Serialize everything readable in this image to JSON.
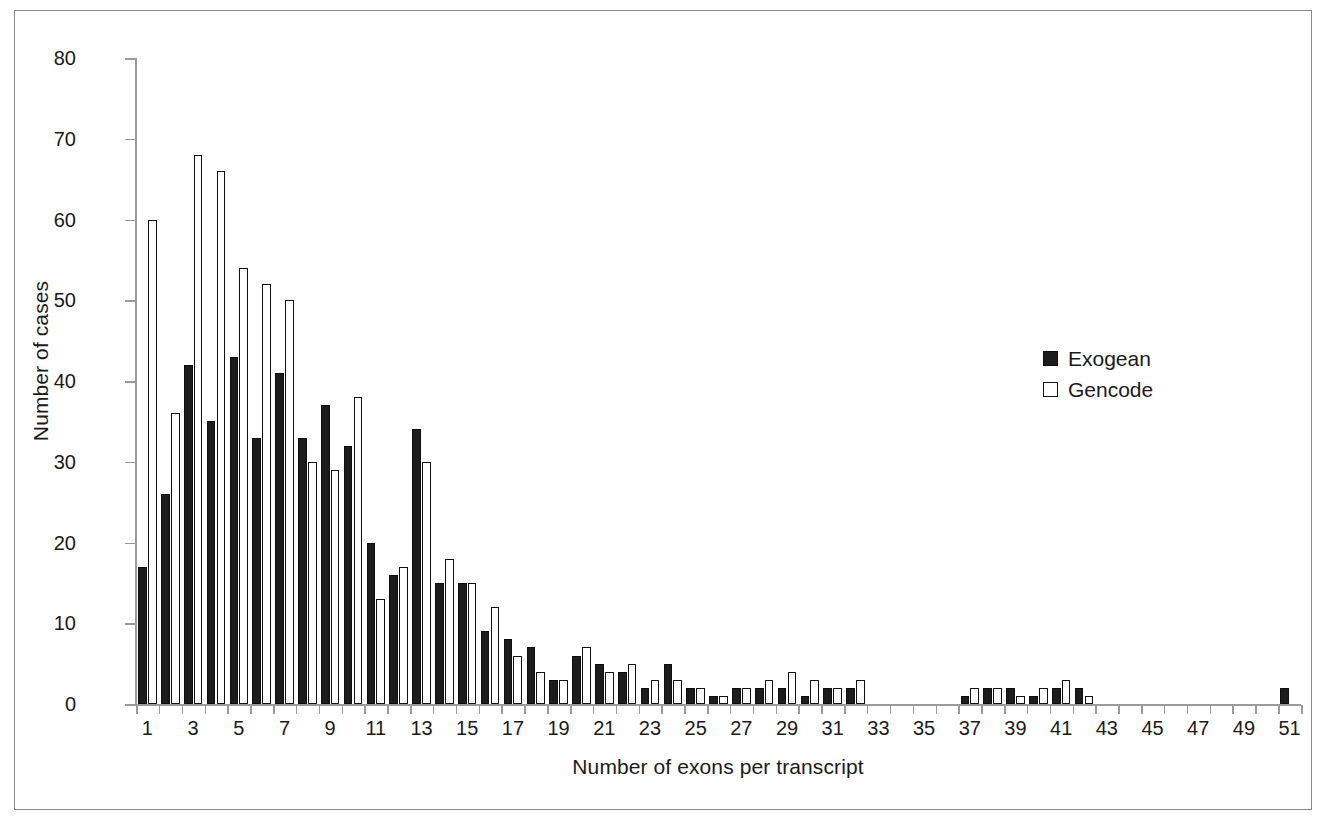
{
  "chart_data": {
    "type": "bar",
    "title": "",
    "xlabel": "Number of exons per transcript",
    "ylabel": "Number of cases",
    "ylim": [
      0,
      80
    ],
    "ytick_labels": [
      "0",
      "10",
      "20",
      "30",
      "40",
      "50",
      "60",
      "70",
      "80"
    ],
    "ytick_values": [
      0,
      10,
      20,
      30,
      40,
      50,
      60,
      70,
      80
    ],
    "grid": false,
    "legend_position": "right",
    "categories": [
      1,
      2,
      3,
      4,
      5,
      6,
      7,
      8,
      9,
      10,
      11,
      12,
      13,
      14,
      15,
      16,
      17,
      18,
      19,
      20,
      21,
      22,
      23,
      24,
      25,
      26,
      27,
      28,
      29,
      30,
      31,
      32,
      33,
      34,
      35,
      36,
      37,
      38,
      39,
      40,
      41,
      42,
      43,
      44,
      45,
      46,
      47,
      48,
      49,
      50,
      51
    ],
    "xtick_labels": [
      "1",
      "3",
      "5",
      "7",
      "9",
      "11",
      "13",
      "15",
      "17",
      "19",
      "21",
      "23",
      "25",
      "27",
      "29",
      "31",
      "33",
      "35",
      "37",
      "39",
      "41",
      "43",
      "45",
      "47",
      "49",
      "51"
    ],
    "series": [
      {
        "name": "Exogean",
        "color": "#1c1c1c",
        "style": "filled",
        "values": [
          17,
          26,
          42,
          35,
          43,
          33,
          41,
          33,
          37,
          32,
          20,
          16,
          34,
          15,
          15,
          9,
          8,
          7,
          3,
          6,
          5,
          4,
          2,
          5,
          2,
          1,
          2,
          2,
          2,
          1,
          2,
          2,
          0,
          0,
          0,
          0,
          1,
          2,
          2,
          1,
          2,
          2,
          0,
          0,
          0,
          0,
          0,
          0,
          0,
          0,
          2
        ]
      },
      {
        "name": "Gencode",
        "color": "#ffffff",
        "style": "outlined",
        "values": [
          60,
          36,
          68,
          66,
          54,
          52,
          50,
          30,
          29,
          38,
          13,
          17,
          30,
          18,
          15,
          12,
          6,
          4,
          3,
          7,
          4,
          5,
          3,
          3,
          2,
          1,
          2,
          3,
          4,
          3,
          2,
          3,
          0,
          0,
          0,
          0,
          2,
          2,
          1,
          2,
          3,
          1,
          0,
          0,
          0,
          0,
          0,
          0,
          0,
          0,
          0
        ]
      }
    ]
  },
  "legend": {
    "items": [
      {
        "label": "Exogean",
        "swatch": "filled-square-icon"
      },
      {
        "label": "Gencode",
        "swatch": "outlined-square-icon"
      }
    ]
  }
}
